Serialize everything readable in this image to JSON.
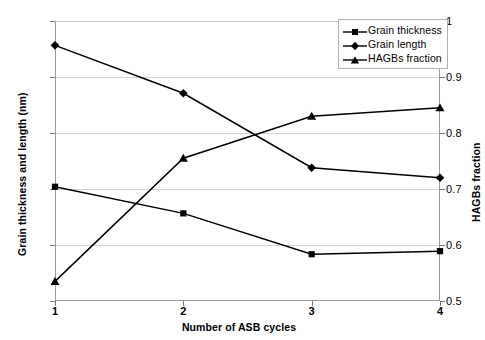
{
  "chart_data": {
    "type": "line",
    "title": "",
    "xlabel": "Number of ASB cycles",
    "ylabel": "Grain thickness and length (nm)",
    "y2label": "HAGBs fraction",
    "x": [
      1,
      2,
      3,
      4
    ],
    "xticklabels": [
      "1",
      "2",
      "3",
      "4"
    ],
    "xlim": [
      1,
      4
    ],
    "ylim": [
      0,
      1000
    ],
    "yticklabels": [
      "0",
      "200",
      "400",
      "600",
      "800",
      "1000"
    ],
    "yticks": [
      0,
      200,
      400,
      600,
      800,
      1000
    ],
    "y2lim": [
      0.5,
      1
    ],
    "y2ticklabels": [
      "0.5",
      "0.6",
      "0.7",
      "0.8",
      "0.9",
      "1"
    ],
    "y2ticks": [
      0.5,
      0.6,
      0.7,
      0.8,
      0.9,
      1
    ],
    "grid": true,
    "legend_position": "top-right",
    "series": [
      {
        "name": "Grain thickness",
        "axis": "left",
        "marker": "square",
        "color": "#000000",
        "values": [
          408,
          313,
          167,
          178
        ]
      },
      {
        "name": "Grain length",
        "axis": "left",
        "marker": "diamond",
        "color": "#000000",
        "values": [
          913,
          742,
          476,
          440
        ]
      },
      {
        "name": "HAGBs fraction",
        "axis": "right",
        "marker": "triangle",
        "color": "#000000",
        "values": [
          0.535,
          0.755,
          0.83,
          0.845
        ]
      }
    ]
  },
  "legend": {
    "items": [
      {
        "label": "Grain thickness"
      },
      {
        "label": "Grain length"
      },
      {
        "label": "HAGBs fraction"
      }
    ]
  }
}
